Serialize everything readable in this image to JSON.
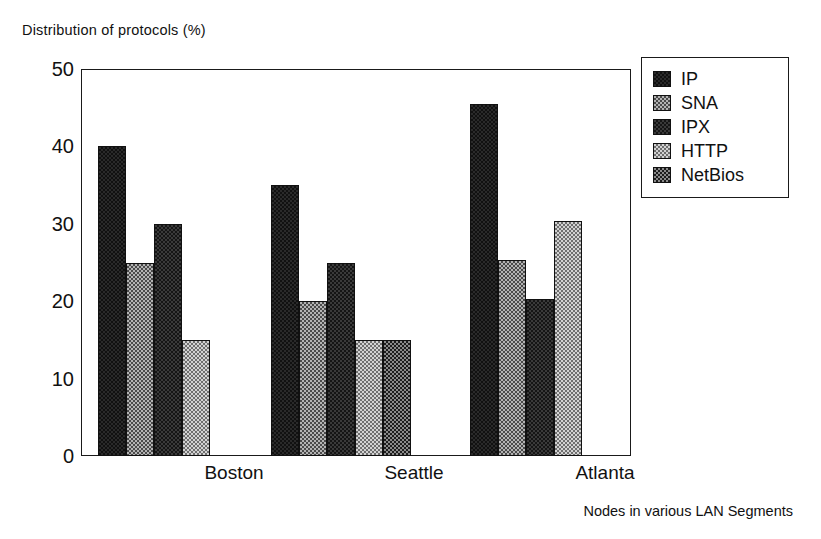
{
  "chart_data": {
    "type": "bar",
    "title": "Distribution of protocols (%)",
    "xlabel": "Nodes in various LAN Segments",
    "ylabel": "",
    "categories": [
      "Boston",
      "Seattle",
      "Atlanta"
    ],
    "series": [
      {
        "name": "IP",
        "color": "#2a2a2a",
        "values": [
          40,
          35,
          45.5
        ]
      },
      {
        "name": "SNA",
        "color": "#b3b3b3",
        "values": [
          25,
          20,
          25.3
        ]
      },
      {
        "name": "IPX",
        "color": "#3a3a3a",
        "values": [
          30,
          25,
          20.3
        ]
      },
      {
        "name": "HTTP",
        "color": "#d2d2d2",
        "values": [
          15,
          15,
          30.4
        ]
      },
      {
        "name": "NetBios",
        "color": "#8a8a8a",
        "values": [
          null,
          15,
          null
        ]
      }
    ],
    "ylim": [
      0,
      50
    ],
    "yticks": [
      0,
      10,
      20,
      30,
      40,
      50
    ],
    "ytick_labels": [
      "0",
      "10",
      "20",
      "30",
      "40",
      "50"
    ],
    "yminor_ticks": [
      5,
      15,
      25,
      35,
      45
    ],
    "grid": false,
    "legend_position": "right-outside",
    "legend_entries": [
      "IP",
      "SNA",
      "IPX",
      "HTTP",
      "NetBios"
    ]
  },
  "title": {
    "text": "Distribution of protocols (%)"
  },
  "caption": {
    "text": "Nodes in various LAN Segments"
  }
}
